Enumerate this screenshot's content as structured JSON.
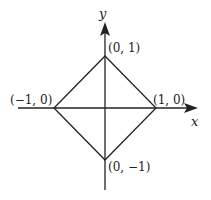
{
  "diagram": {
    "title": "",
    "axes": {
      "x_label": "x",
      "y_label": "y"
    },
    "vertices": [
      {
        "name": "top",
        "label": "(0, 1)"
      },
      {
        "name": "left",
        "label": "(−1, 0)"
      },
      {
        "name": "right",
        "label": "(1, 0)"
      },
      {
        "name": "bottom",
        "label": "(0, −1)"
      }
    ],
    "colors": {
      "stroke": "#222222",
      "background": "#ffffff"
    }
  }
}
